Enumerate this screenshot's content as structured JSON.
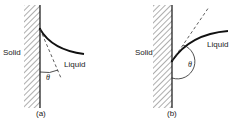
{
  "figure": {
    "panels": [
      {
        "id": "a",
        "caption": "(a)",
        "solid_label": "Solid",
        "liquid_label": "Liquid",
        "angle_label": "θ",
        "contact_angle_type": "acute"
      },
      {
        "id": "b",
        "caption": "(b)",
        "solid_label": "Solid",
        "liquid_label": "Liquid",
        "angle_label": "θ",
        "contact_angle_type": "obtuse"
      }
    ]
  }
}
